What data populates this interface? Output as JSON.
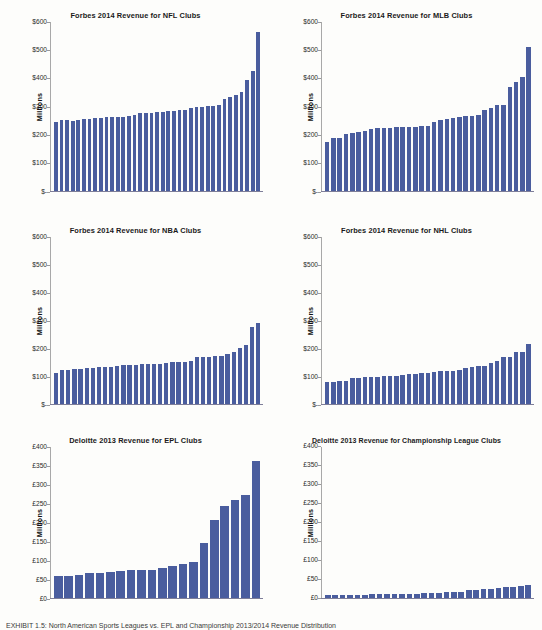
{
  "document": {
    "caption": "EXHIBIT 1.5: North American Sports Leagues vs. EPL and Championship 2013/2014 Revenue Distribution"
  },
  "chart_data": [
    {
      "id": "nfl",
      "type": "bar",
      "title": "Forbes 2014 Revenue for NFL Clubs",
      "xlabel": "",
      "ylabel": "Millions",
      "currency": "$",
      "ylim": [
        0,
        600
      ],
      "yticks": [
        600,
        500,
        400,
        300,
        200,
        100,
        0
      ],
      "ytick_labels": [
        "$600",
        "$500",
        "$400",
        "$300",
        "$200",
        "$100",
        "$-"
      ],
      "grid": false,
      "legend": "none",
      "bar_color": "#4a5d9e",
      "values": [
        243,
        250,
        250,
        249,
        252,
        255,
        256,
        258,
        259,
        262,
        262,
        262,
        263,
        266,
        270,
        275,
        276,
        277,
        279,
        281,
        283,
        284,
        285,
        286,
        292,
        296,
        297,
        299,
        301,
        305,
        327,
        332,
        338,
        350,
        393,
        425,
        560
      ]
    },
    {
      "id": "mlb",
      "type": "bar",
      "title": "Forbes 2014 Revenue for MLB Clubs",
      "xlabel": "",
      "ylabel": "Millions",
      "currency": "$",
      "ylim": [
        0,
        600
      ],
      "yticks": [
        600,
        500,
        400,
        300,
        200,
        100,
        0
      ],
      "ytick_labels": [
        "$600",
        "$500",
        "$400",
        "$300",
        "$200",
        "$100",
        "$-"
      ],
      "grid": false,
      "legend": "none",
      "bar_color": "#4a5d9e",
      "values": [
        174,
        188,
        189,
        201,
        206,
        209,
        212,
        219,
        222,
        223,
        224,
        225,
        226,
        226,
        228,
        229,
        229,
        244,
        250,
        253,
        259,
        263,
        265,
        266,
        268,
        286,
        295,
        303,
        305,
        368,
        386,
        403,
        508
      ]
    },
    {
      "id": "nba",
      "type": "bar",
      "title": "Forbes 2014 Revenue for NBA Clubs",
      "xlabel": "",
      "ylabel": "Millions",
      "currency": "$",
      "ylim": [
        0,
        600
      ],
      "yticks": [
        600,
        500,
        400,
        300,
        200,
        100,
        0
      ],
      "ytick_labels": [
        "$600",
        "$500",
        "$400",
        "$300",
        "$200",
        "$100",
        "$-"
      ],
      "grid": false,
      "legend": "none",
      "bar_color": "#4a5d9e",
      "values": [
        110,
        122,
        123,
        126,
        127,
        129,
        130,
        131,
        132,
        133,
        137,
        139,
        140,
        141,
        142,
        143,
        144,
        145,
        147,
        150,
        151,
        152,
        154,
        167,
        168,
        170,
        171,
        173,
        180,
        186,
        200,
        210,
        274,
        290
      ]
    },
    {
      "id": "nhl",
      "type": "bar",
      "title": "Forbes 2014 Revenue for NHL Clubs",
      "xlabel": "",
      "ylabel": "Millions",
      "currency": "$",
      "ylim": [
        0,
        600
      ],
      "yticks": [
        600,
        500,
        400,
        300,
        200,
        100,
        0
      ],
      "ytick_labels": [
        "$600",
        "$500",
        "$400",
        "$300",
        "$200",
        "$100",
        "$-"
      ],
      "grid": false,
      "legend": "none",
      "bar_color": "#4a5d9e",
      "values": [
        78,
        80,
        81,
        84,
        92,
        95,
        96,
        97,
        98,
        99,
        100,
        101,
        105,
        107,
        108,
        110,
        113,
        115,
        117,
        117,
        118,
        122,
        130,
        134,
        137,
        138,
        146,
        154,
        167,
        170,
        185,
        188,
        215
      ]
    },
    {
      "id": "epl",
      "type": "bar",
      "title": "Deloitte 2013 Revenue for EPL Clubs",
      "xlabel": "",
      "ylabel": "Millions",
      "currency": "£",
      "ylim": [
        0,
        400
      ],
      "yticks": [
        400,
        350,
        300,
        250,
        200,
        150,
        100,
        50,
        0
      ],
      "ytick_labels": [
        "£400",
        "£350",
        "£300",
        "£250",
        "£200",
        "£150",
        "£100",
        "£50",
        "£0"
      ],
      "grid": false,
      "legend": "none",
      "bar_color": "#4a5d9e",
      "values": [
        58,
        58,
        60,
        66,
        66,
        69,
        71,
        73,
        74,
        74,
        80,
        85,
        89,
        94,
        146,
        205,
        243,
        259,
        271,
        361
      ]
    },
    {
      "id": "championship",
      "type": "bar",
      "title": "Deloitte 2013 Revenue for Championship League Clubs",
      "xlabel": "",
      "ylabel": "Millions",
      "currency": "£",
      "ylim": [
        0,
        400
      ],
      "yticks": [
        400,
        350,
        300,
        250,
        200,
        150,
        100,
        50,
        0
      ],
      "ytick_labels": [
        "£400",
        "£350",
        "£300",
        "£250",
        "£200",
        "£150",
        "£100",
        "£50",
        "£0"
      ],
      "grid": false,
      "legend": "none",
      "bar_color": "#4a5d9e",
      "values": [
        6,
        6,
        6,
        7,
        7,
        8,
        9,
        10,
        10,
        10,
        11,
        11,
        11,
        12,
        13,
        13,
        14,
        15,
        16,
        19,
        21,
        22,
        24,
        26,
        27,
        29,
        30,
        34
      ]
    }
  ]
}
